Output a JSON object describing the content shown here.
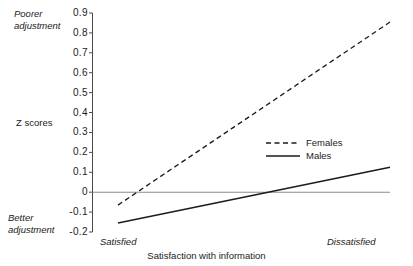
{
  "chart_data": {
    "type": "line",
    "title": "",
    "subtitle": "",
    "xlabel": "Satisfaction with information",
    "ylabel": "Z scores",
    "x_tick_labels": [
      "Satisfied",
      "Dissatisfied"
    ],
    "x": [
      0,
      1
    ],
    "xlim": [
      0,
      1
    ],
    "ylim": [
      -0.2,
      0.9
    ],
    "y_tick_labels": [
      "0.9",
      "0.8",
      "0.7",
      "0.6",
      "0.5",
      "0.4",
      "0.3",
      "0.2",
      "0.1",
      "0",
      "-0.1",
      "-0.2"
    ],
    "y_ticks": [
      0.9,
      0.8,
      0.7,
      0.6,
      0.5,
      0.4,
      0.3,
      0.2,
      0.1,
      0.0,
      -0.1,
      -0.2
    ],
    "grid": false,
    "legend_position": "center-right",
    "reference_line": {
      "value": 0,
      "color": "#8c8c8c"
    },
    "annotations": {
      "top_left": "Poorer adjustment",
      "bottom_left": "Better adjustment"
    },
    "series": [
      {
        "name": "Females",
        "style": "dashed",
        "color": "#1b1b1b",
        "values": [
          -0.065,
          0.855
        ]
      },
      {
        "name": "Males",
        "style": "solid",
        "color": "#1b1b1b",
        "values": [
          -0.155,
          0.125
        ]
      }
    ]
  },
  "axis": {
    "y_label": "Z scores",
    "x_title": "Satisfaction with information",
    "x_left": "Satisfied",
    "x_right": "Dissatisfied",
    "poorer": "Poorer adjustment",
    "better": "Better adjustment",
    "ticks": [
      "0.9",
      "0.8",
      "0.7",
      "0.6",
      "0.5",
      "0.4",
      "0.3",
      "0.2",
      "0.1",
      "0",
      "-0.1",
      "-0.2"
    ]
  },
  "legend": {
    "items": [
      {
        "label": "Females",
        "style": "dashed"
      },
      {
        "label": "Males",
        "style": "solid"
      }
    ]
  },
  "colors": {
    "line": "#1b1b1b",
    "zero_line": "#8c8c8c",
    "axis": "#4a4a4a",
    "text": "#1b1b1b",
    "background": "#ffffff"
  }
}
